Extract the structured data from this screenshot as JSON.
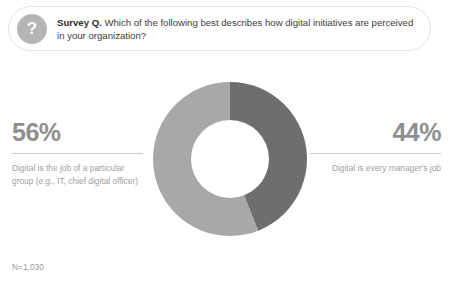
{
  "header": {
    "badge_icon": "question-mark-icon",
    "badge_glyph": "?",
    "lead": "Survey Q.",
    "question": " Which of the following best describes how digital initiatives are perceived in your organization?"
  },
  "callouts": {
    "left": {
      "percent": "56%",
      "description": "Digital is the job of a particular group (e.g., IT, chief digital officer)"
    },
    "right": {
      "percent": "44%",
      "description": "Digital is every manager's job"
    }
  },
  "footnote": "N=1,030",
  "colors": {
    "segment_light": "#a8a8a8",
    "segment_dark": "#6e6e6e",
    "badge": "#b5b5b5",
    "rule": "#c9c9c9",
    "pct_text": "#8e8e8e",
    "desc_text": "#a0a0a0"
  },
  "chart_data": {
    "type": "pie",
    "variant": "donut",
    "title": "Which of the following best describes how digital initiatives are perceived in your organization?",
    "categories": [
      "Digital is every manager's job",
      "Digital is the job of a particular group (e.g., IT, chief digital officer)"
    ],
    "values": [
      44,
      56
    ],
    "labels": [
      "44%",
      "56%"
    ],
    "colors": [
      "#6e6e6e",
      "#a8a8a8"
    ],
    "units": "percent",
    "sample_size": "N=1,030",
    "start_angle_deg": 0,
    "direction": "clockwise",
    "inner_radius_ratio": 0.506,
    "legend": "side-callouts",
    "grid": false,
    "xlabel": "",
    "ylabel": ""
  }
}
